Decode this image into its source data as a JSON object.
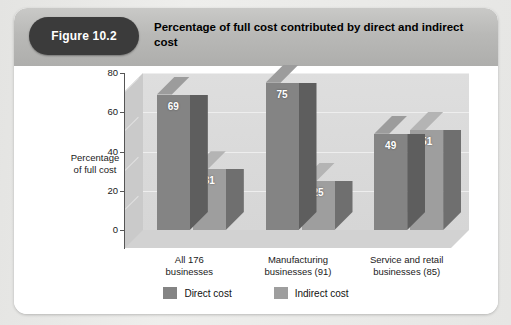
{
  "figure": {
    "badge": "Figure 10.2",
    "title": "Percentage of full cost contributed by direct and indirect cost"
  },
  "chart_data": {
    "type": "bar",
    "title": "Percentage of full cost contributed by direct and indirect cost",
    "xlabel": "",
    "ylabel": "Percentage of full cost",
    "ylim": [
      0,
      80
    ],
    "yticks": [
      "0",
      "20",
      "40",
      "60",
      "80"
    ],
    "grid": true,
    "legend_position": "bottom",
    "categories": [
      "All 176 businesses",
      "Manufacturing businesses (91)",
      "Service and retail businesses (85)"
    ],
    "category_lines": [
      [
        "All 176",
        "businesses"
      ],
      [
        "Manufacturing",
        "businesses (91)"
      ],
      [
        "Service and retail",
        "businesses (85)"
      ]
    ],
    "series": [
      {
        "name": "Direct cost",
        "color": "#848484",
        "values": [
          69,
          75,
          49
        ]
      },
      {
        "name": "Indirect cost",
        "color": "#9e9e9e",
        "values": [
          31,
          25,
          51
        ]
      }
    ]
  },
  "legend": [
    {
      "label": "Direct cost"
    },
    {
      "label": "Indirect cost"
    }
  ]
}
